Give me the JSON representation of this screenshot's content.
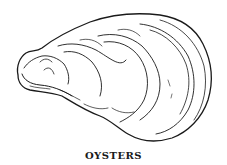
{
  "figure": {
    "caption": "OYSTERS",
    "ink_color": "#1a1a1a",
    "background": "#ffffff"
  }
}
